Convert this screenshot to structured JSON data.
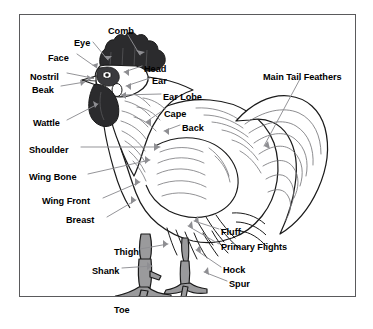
{
  "diagram": {
    "frame_color": "#5a5a5c",
    "background_color": "#ffffff",
    "label_color": "#000000",
    "leader_line_color": "#8e8e92",
    "comb_fill": "#2b2b2d",
    "leg_fill": "#9a9a9c"
  },
  "labels": [
    {
      "id": "comb",
      "text": "Comb",
      "x": 108,
      "y": 26,
      "align": "left"
    },
    {
      "id": "eye",
      "text": "Eye",
      "x": 74,
      "y": 38,
      "align": "left"
    },
    {
      "id": "face",
      "text": "Face",
      "x": 48,
      "y": 53,
      "align": "left"
    },
    {
      "id": "nostril",
      "text": "Nostril",
      "x": 30,
      "y": 72,
      "align": "left"
    },
    {
      "id": "beak",
      "text": "Beak",
      "x": 32,
      "y": 85,
      "align": "left"
    },
    {
      "id": "wattle",
      "text": "Wattle",
      "x": 33,
      "y": 118,
      "align": "left"
    },
    {
      "id": "shoulder",
      "text": "Shoulder",
      "x": 29,
      "y": 145,
      "align": "left"
    },
    {
      "id": "wing-bone",
      "text": "Wing Bone",
      "x": 29,
      "y": 172,
      "align": "left"
    },
    {
      "id": "wing-front",
      "text": "Wing Front",
      "x": 42,
      "y": 196,
      "align": "left"
    },
    {
      "id": "breast",
      "text": "Breast",
      "x": 66,
      "y": 215,
      "align": "left"
    },
    {
      "id": "thigh",
      "text": "Thigh",
      "x": 114,
      "y": 247,
      "align": "left"
    },
    {
      "id": "shank",
      "text": "Shank",
      "x": 92,
      "y": 266,
      "align": "left"
    },
    {
      "id": "toe",
      "text": "Toe",
      "x": 114,
      "y": 305,
      "align": "left"
    },
    {
      "id": "head",
      "text": "Head",
      "x": 144,
      "y": 64,
      "align": "left"
    },
    {
      "id": "ear",
      "text": "Ear",
      "x": 152,
      "y": 76,
      "align": "left"
    },
    {
      "id": "ear-lobe",
      "text": "Ear Lobe",
      "x": 163,
      "y": 92,
      "align": "left"
    },
    {
      "id": "cape",
      "text": "Cape",
      "x": 164,
      "y": 109,
      "align": "left"
    },
    {
      "id": "back",
      "text": "Back",
      "x": 182,
      "y": 123,
      "align": "left"
    },
    {
      "id": "main-tail-feathers",
      "text": "Main Tail Feathers",
      "x": 263,
      "y": 72,
      "align": "left"
    },
    {
      "id": "fluff",
      "text": "Fluff",
      "x": 221,
      "y": 227,
      "align": "left"
    },
    {
      "id": "primary-flights",
      "text": "Primary Flights",
      "x": 221,
      "y": 242,
      "align": "left"
    },
    {
      "id": "hock",
      "text": "Hock",
      "x": 223,
      "y": 265,
      "align": "left"
    },
    {
      "id": "spur",
      "text": "Spur",
      "x": 229,
      "y": 279,
      "align": "left"
    }
  ]
}
